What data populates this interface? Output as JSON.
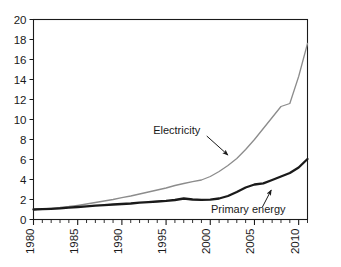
{
  "chart_data": {
    "type": "line",
    "title": "",
    "subtitle": "",
    "xlabel": "",
    "ylabel": "",
    "xlim": [
      1980,
      2011
    ],
    "ylim": [
      0,
      20
    ],
    "yticks": [
      0,
      2,
      4,
      6,
      8,
      10,
      12,
      14,
      16,
      18,
      20
    ],
    "ytick_labels": [
      "0",
      "2",
      "4",
      "6",
      "8",
      "10",
      "12",
      "14",
      "16",
      "18",
      "20"
    ],
    "xticks_major": [
      1980,
      1985,
      1990,
      1995,
      2000,
      2005,
      2010
    ],
    "xtick_labels": [
      "1980",
      "1985",
      "1990",
      "1995",
      "2000",
      "2005",
      "2010"
    ],
    "xtick_minor_step": 1,
    "xtick_label_rotation": -90,
    "grid": false,
    "legend": "inline-annotations",
    "legend_position": "inline",
    "annotations": [
      {
        "name": "electricity-annotation",
        "text": "Electricity",
        "text_x": 1996.2,
        "text_y": 8.6,
        "arrow_from": [
          1999.6,
          8.35
        ],
        "arrow_to": [
          2002.0,
          6.45
        ]
      },
      {
        "name": "primary-energy-annotation",
        "text": "Primary energy",
        "text_x": 2004.3,
        "text_y": 0.62,
        "arrow_from": [
          2005.9,
          1.25
        ],
        "arrow_to": [
          2006.9,
          2.95
        ]
      }
    ],
    "x": [
      1980,
      1981,
      1982,
      1983,
      1984,
      1985,
      1986,
      1987,
      1988,
      1989,
      1990,
      1991,
      1992,
      1993,
      1994,
      1995,
      1996,
      1997,
      1998,
      1999,
      2000,
      2001,
      2002,
      2003,
      2004,
      2005,
      2006,
      2007,
      2008,
      2009,
      2010,
      2011
    ],
    "series": [
      {
        "name": "Electricity",
        "color": "#8c8c8c",
        "line_width": 1.3,
        "values": [
          1.0,
          1.05,
          1.12,
          1.2,
          1.3,
          1.42,
          1.55,
          1.7,
          1.85,
          2.0,
          2.18,
          2.35,
          2.55,
          2.75,
          2.95,
          3.15,
          3.4,
          3.6,
          3.78,
          3.95,
          4.3,
          4.8,
          5.4,
          6.1,
          7.0,
          8.0,
          9.1,
          10.2,
          11.3,
          11.6,
          14.3,
          17.6
        ]
      },
      {
        "name": "Primary energy",
        "color": "#1a1a1a",
        "line_width": 2.3,
        "values": [
          1.0,
          1.03,
          1.07,
          1.12,
          1.18,
          1.25,
          1.32,
          1.38,
          1.44,
          1.5,
          1.55,
          1.6,
          1.68,
          1.74,
          1.8,
          1.86,
          1.95,
          2.1,
          2.0,
          1.97,
          1.98,
          2.1,
          2.35,
          2.75,
          3.2,
          3.5,
          3.62,
          3.95,
          4.3,
          4.65,
          5.2,
          6.05
        ]
      }
    ]
  },
  "axes": {
    "y_axis_name": "y-axis",
    "x_axis_name": "x-axis"
  }
}
